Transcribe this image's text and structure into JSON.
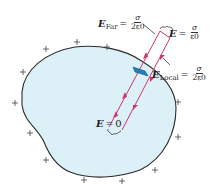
{
  "diagram": {
    "colors": {
      "conductor_fill": "#dcf0f8",
      "conductor_outline": "#2b2b2b",
      "field_lines": "#d2336e",
      "surface_patch": "#1f7fb8",
      "text": "#222222"
    },
    "charges": {
      "symbol": "+",
      "count": 12
    },
    "labels": {
      "e_far": {
        "symbol": "E",
        "subscript": "Far",
        "equals": "=",
        "numerator": "σ",
        "denominator": "2ε0"
      },
      "e_total": {
        "symbol": "E",
        "equals": "=",
        "numerator": "σ",
        "denominator": "ε0"
      },
      "e_local": {
        "symbol": "E",
        "subscript": "Local",
        "equals": "=",
        "numerator": "σ",
        "denominator": "2ε0"
      },
      "e_inside": {
        "symbol": "E",
        "equals": "=",
        "value": "0"
      }
    }
  }
}
